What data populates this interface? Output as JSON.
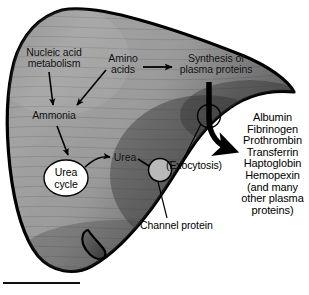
{
  "figure": {
    "organ_name": "liver",
    "scale_bar": ""
  },
  "labels": {
    "nucleic_acid": "Nucleic acid\nmetabolism",
    "amino_acids": "Amino\nacids",
    "synthesis": "Synthesis of\nplasma proteins",
    "ammonia": "Ammonia",
    "urea_cycle": "Urea\ncycle",
    "urea": "Urea",
    "exocytosis": "(Exocytosis)",
    "channel_protein": "Channel protein"
  },
  "protein_list": [
    "Albumin",
    "Fibrinogen",
    "Prothrombin",
    "Transferrin",
    "Haptoglobin",
    "Hemopexin",
    "(and many",
    "other plasma",
    "proteins)"
  ],
  "colors": {
    "organ_fill_light": "#a0a0a0",
    "organ_fill_dark": "#4a4a4a",
    "organ_outline": "#000000",
    "text": "#000000",
    "arrow": "#000000",
    "cycle_fill": "#ffffff",
    "channel_fill": "#b9b9b9",
    "background": "#ffffff"
  }
}
